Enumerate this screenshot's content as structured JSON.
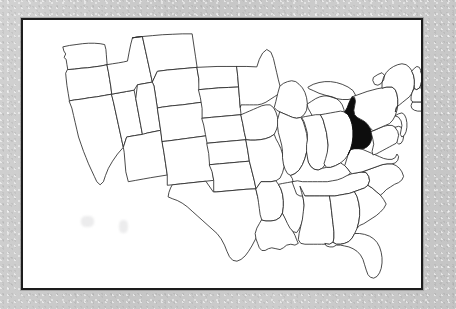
{
  "document": {
    "type": "map",
    "title": "United States state outline map",
    "medium": "scanned printed page",
    "page_background_color": "#c9c9c9",
    "map_background_color": "#ffffff",
    "frame_color": "#1d1d1d",
    "frame_width_px": 2,
    "outline_color": "#2a2a2a",
    "highlight_color": "#0d0d0d"
  },
  "map": {
    "name": "contiguous-united-states",
    "projection_note": "conic, continental US only; Alaska and Hawaii not shown",
    "highlighted_state": "West Virginia",
    "highlighted_state_abbr": "WV",
    "labels_shown": false,
    "legend_shown": false,
    "title_shown": false,
    "states_outlined": 49,
    "states": [
      {
        "abbr": "WA",
        "name": "Washington",
        "highlighted": false
      },
      {
        "abbr": "OR",
        "name": "Oregon",
        "highlighted": false
      },
      {
        "abbr": "CA",
        "name": "California",
        "highlighted": false
      },
      {
        "abbr": "NV",
        "name": "Nevada",
        "highlighted": false
      },
      {
        "abbr": "ID",
        "name": "Idaho",
        "highlighted": false
      },
      {
        "abbr": "MT",
        "name": "Montana",
        "highlighted": false
      },
      {
        "abbr": "WY",
        "name": "Wyoming",
        "highlighted": false
      },
      {
        "abbr": "UT",
        "name": "Utah",
        "highlighted": false
      },
      {
        "abbr": "AZ",
        "name": "Arizona",
        "highlighted": false
      },
      {
        "abbr": "CO",
        "name": "Colorado",
        "highlighted": false
      },
      {
        "abbr": "NM",
        "name": "New Mexico",
        "highlighted": false
      },
      {
        "abbr": "ND",
        "name": "North Dakota",
        "highlighted": false
      },
      {
        "abbr": "SD",
        "name": "South Dakota",
        "highlighted": false
      },
      {
        "abbr": "NE",
        "name": "Nebraska",
        "highlighted": false
      },
      {
        "abbr": "KS",
        "name": "Kansas",
        "highlighted": false
      },
      {
        "abbr": "OK",
        "name": "Oklahoma",
        "highlighted": false
      },
      {
        "abbr": "TX",
        "name": "Texas",
        "highlighted": false
      },
      {
        "abbr": "MN",
        "name": "Minnesota",
        "highlighted": false
      },
      {
        "abbr": "IA",
        "name": "Iowa",
        "highlighted": false
      },
      {
        "abbr": "MO",
        "name": "Missouri",
        "highlighted": false
      },
      {
        "abbr": "AR",
        "name": "Arkansas",
        "highlighted": false
      },
      {
        "abbr": "LA",
        "name": "Louisiana",
        "highlighted": false
      },
      {
        "abbr": "WI",
        "name": "Wisconsin",
        "highlighted": false
      },
      {
        "abbr": "IL",
        "name": "Illinois",
        "highlighted": false
      },
      {
        "abbr": "MS",
        "name": "Mississippi",
        "highlighted": false
      },
      {
        "abbr": "MI",
        "name": "Michigan",
        "highlighted": false
      },
      {
        "abbr": "IN",
        "name": "Indiana",
        "highlighted": false
      },
      {
        "abbr": "KY",
        "name": "Kentucky",
        "highlighted": false
      },
      {
        "abbr": "TN",
        "name": "Tennessee",
        "highlighted": false
      },
      {
        "abbr": "AL",
        "name": "Alabama",
        "highlighted": false
      },
      {
        "abbr": "OH",
        "name": "Ohio",
        "highlighted": false
      },
      {
        "abbr": "GA",
        "name": "Georgia",
        "highlighted": false
      },
      {
        "abbr": "FL",
        "name": "Florida",
        "highlighted": false
      },
      {
        "abbr": "SC",
        "name": "South Carolina",
        "highlighted": false
      },
      {
        "abbr": "NC",
        "name": "North Carolina",
        "highlighted": false
      },
      {
        "abbr": "VA",
        "name": "Virginia",
        "highlighted": false
      },
      {
        "abbr": "WV",
        "name": "West Virginia",
        "highlighted": true
      },
      {
        "abbr": "MD",
        "name": "Maryland",
        "highlighted": false
      },
      {
        "abbr": "DE",
        "name": "Delaware",
        "highlighted": false
      },
      {
        "abbr": "PA",
        "name": "Pennsylvania",
        "highlighted": false
      },
      {
        "abbr": "NJ",
        "name": "New Jersey",
        "highlighted": false
      },
      {
        "abbr": "NY",
        "name": "New York",
        "highlighted": false
      },
      {
        "abbr": "CT",
        "name": "Connecticut",
        "highlighted": false
      },
      {
        "abbr": "RI",
        "name": "Rhode Island",
        "highlighted": false
      },
      {
        "abbr": "MA",
        "name": "Massachusetts",
        "highlighted": false
      },
      {
        "abbr": "VT",
        "name": "Vermont",
        "highlighted": false
      },
      {
        "abbr": "NH",
        "name": "New Hampshire",
        "highlighted": false
      },
      {
        "abbr": "ME",
        "name": "Maine",
        "highlighted": false
      }
    ]
  }
}
